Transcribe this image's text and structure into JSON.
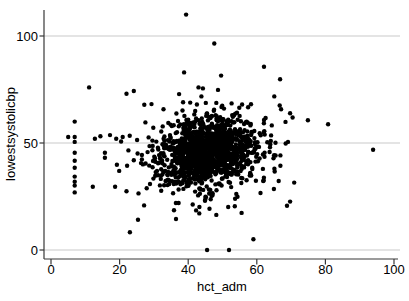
{
  "chart_data": {
    "type": "scatter",
    "title": "",
    "xlabel": "hct_adm",
    "ylabel": "lowestsystolicbp",
    "xlim": [
      0,
      100
    ],
    "ylim": [
      0,
      112
    ],
    "xticks": [
      0,
      20,
      40,
      60,
      80,
      100
    ],
    "yticks": [
      0,
      50,
      100
    ],
    "grid": "horizontal-at-yticks",
    "legend": "none",
    "marker": {
      "shape": "circle",
      "color": "#000000",
      "radius": 2.2
    },
    "colors": {
      "background": "#ffffff",
      "grid": "#c9c9c9",
      "axis": "#383838",
      "text": "#000000"
    },
    "points": [
      [
        39.4,
        110
      ],
      [
        47.6,
        96.5
      ],
      [
        62.1,
        85.6
      ],
      [
        38.8,
        83
      ],
      [
        49.6,
        81.5
      ],
      [
        66.8,
        79.8
      ],
      [
        11.1,
        76
      ],
      [
        43.0,
        76
      ],
      [
        44.3,
        75.5
      ],
      [
        48.7,
        74.8
      ],
      [
        22.0,
        73
      ],
      [
        27.2,
        67.9
      ],
      [
        29.3,
        68.2
      ],
      [
        32.8,
        65.8
      ],
      [
        38.5,
        69
      ],
      [
        6.9,
        60
      ],
      [
        5.0,
        52.8
      ],
      [
        6.9,
        52.8
      ],
      [
        6.9,
        50.5
      ],
      [
        6.9,
        45.4
      ],
      [
        6.9,
        41.7
      ],
      [
        6.9,
        38.4
      ],
      [
        6.9,
        34.3
      ],
      [
        6.9,
        31.9
      ],
      [
        6.9,
        30.1
      ],
      [
        6.9,
        26.9
      ],
      [
        12.8,
        52
      ],
      [
        14.4,
        53.2
      ],
      [
        17.2,
        53.7
      ],
      [
        19.0,
        52.0
      ],
      [
        20.9,
        52.8
      ],
      [
        25.1,
        51.4
      ],
      [
        15.7,
        45.4
      ],
      [
        15.7,
        43.1
      ],
      [
        19.2,
        39.8
      ],
      [
        22.2,
        39.4
      ],
      [
        26.5,
        44.4
      ],
      [
        26.5,
        42.3
      ],
      [
        12.2,
        29.6
      ],
      [
        18.7,
        29.6
      ],
      [
        22.0,
        27.5
      ],
      [
        93.9,
        46.8
      ],
      [
        80.8,
        58.8
      ],
      [
        74.9,
        60.6
      ],
      [
        69.7,
        63.9
      ],
      [
        69.1,
        50.5
      ],
      [
        70.9,
        31.5
      ],
      [
        69.7,
        22.6
      ],
      [
        45.5,
        0
      ],
      [
        51.9,
        0
      ],
      [
        59.0,
        5.0
      ],
      [
        23.0,
        8.3
      ],
      [
        42.3,
        18.5
      ],
      [
        53.6,
        20.4
      ]
    ],
    "cluster": {
      "seed": 42,
      "bounds": {
        "x": [
          18,
          72
        ],
        "y": [
          14,
          76
        ]
      },
      "components": [
        {
          "count": 1150,
          "cx": 45.5,
          "cy": 46.0,
          "sdx": 6.3,
          "sdy": 7.4,
          "rho": 0.18
        },
        {
          "count": 330,
          "cx": 46.0,
          "cy": 45.0,
          "sdx": 10.5,
          "sdy": 12.5,
          "rho": 0.15
        }
      ]
    }
  }
}
